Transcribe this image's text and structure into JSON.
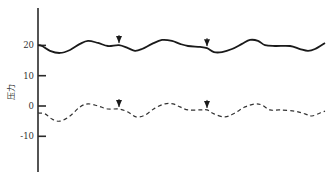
{
  "chart_data": {
    "type": "line",
    "title": "",
    "xlabel": "",
    "ylabel": "压力",
    "ylim": [
      -18,
      32
    ],
    "yticks": [
      20,
      10,
      0,
      -10
    ],
    "ytick_labels": [
      "20",
      "10",
      "0",
      "-10"
    ],
    "grid": false,
    "legend": null,
    "x_axis_visible": false,
    "series": [
      {
        "name": "solid trace",
        "style": "solid",
        "color": "#1a1a1a",
        "x": [
          0,
          4,
          12,
          22,
          32,
          42,
          50,
          60,
          70,
          81,
          90,
          97,
          104,
          114,
          124,
          134,
          142,
          150,
          162,
          169,
          176,
          184,
          194,
          204,
          212,
          220,
          227,
          237,
          252,
          262,
          270,
          277,
          287
        ],
        "values": [
          20.1,
          19.8,
          18.2,
          17.5,
          18.5,
          20.5,
          21.5,
          20.8,
          19.8,
          20.1,
          19.1,
          18.2,
          18.8,
          20.5,
          21.8,
          21.5,
          20.5,
          19.8,
          19.5,
          19.1,
          17.8,
          17.8,
          18.8,
          20.5,
          21.8,
          21.5,
          20.1,
          19.8,
          19.8,
          18.8,
          18.2,
          18.8,
          20.8
        ]
      },
      {
        "name": "dashed trace",
        "style": "dashed",
        "color": "#333333",
        "x": [
          0,
          7,
          14,
          22,
          32,
          42,
          50,
          60,
          70,
          81,
          90,
          98,
          107,
          117,
          127,
          135,
          142,
          150,
          162,
          169,
          176,
          187,
          197,
          207,
          217,
          224,
          232,
          242,
          257,
          267,
          274,
          282,
          287
        ],
        "values": [
          -2.3,
          -2.6,
          -4.3,
          -5.0,
          -3.3,
          -0.3,
          0.7,
          0.0,
          -1.0,
          -1.0,
          -2.0,
          -3.6,
          -3.0,
          -0.7,
          0.7,
          0.7,
          -0.3,
          -1.3,
          -1.3,
          -1.3,
          -2.6,
          -3.6,
          -2.3,
          -0.3,
          0.7,
          0.3,
          -1.3,
          -1.3,
          -1.7,
          -2.6,
          -3.3,
          -2.3,
          -1.7
        ]
      }
    ],
    "annotations": [
      {
        "type": "arrow-down",
        "series": "solid trace",
        "x": 81
      },
      {
        "type": "arrow-down",
        "series": "solid trace",
        "x": 169
      },
      {
        "type": "arrow-down",
        "series": "dashed trace",
        "x": 81
      },
      {
        "type": "arrow-down",
        "series": "dashed trace",
        "x": 169
      }
    ]
  }
}
